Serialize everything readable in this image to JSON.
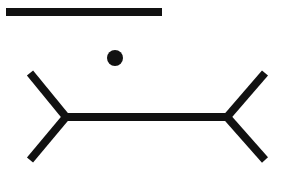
{
  "figure": {
    "type": "muller-lyer-illusion",
    "background": "#ffffff",
    "stroke_color": "#111111",
    "reference_bar": {
      "x1": 6,
      "y1": 12,
      "x2": 162,
      "y2": 12,
      "width": 8
    },
    "fixation_dot": {
      "cx": 115,
      "cy": 58,
      "r": 8
    },
    "main_shaft": {
      "x1": 64,
      "y1": 117,
      "x2": 229,
      "y2": 117,
      "width": 8
    },
    "left_fins": [
      {
        "x1": 30,
        "y1": 73,
        "x2": 66,
        "y2": 117
      },
      {
        "x1": 30,
        "y1": 160,
        "x2": 66,
        "y2": 117
      }
    ],
    "right_fins": [
      {
        "x1": 265,
        "y1": 73,
        "x2": 227,
        "y2": 117
      },
      {
        "x1": 265,
        "y1": 160,
        "x2": 227,
        "y2": 117
      }
    ]
  }
}
